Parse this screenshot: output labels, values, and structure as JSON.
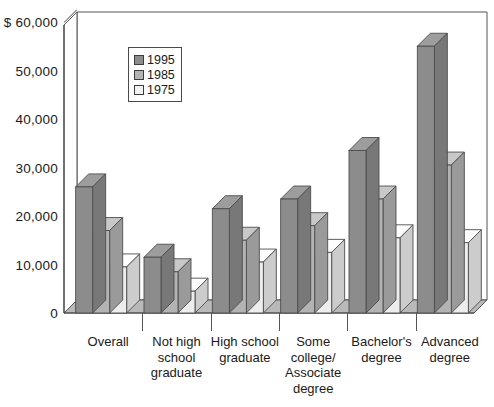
{
  "chart_data": {
    "type": "bar",
    "title": "",
    "subtitle": "",
    "xlabel": "",
    "ylabel": "",
    "y_axis_prefix": "$",
    "categories": [
      "Overall",
      "Not high\nschool\ngraduate",
      "High school\ngraduate",
      "Some\ncollege/\nAssociate\ndegree",
      "Bachelor's\ndegree",
      "Advanced\ndegree"
    ],
    "series": [
      {
        "name": "1995",
        "color": "#8c8c8c",
        "values": [
          26000,
          11500,
          21500,
          23500,
          33500,
          55000
        ]
      },
      {
        "name": "1985",
        "color": "#b3b3b3",
        "values": [
          17000,
          8500,
          15000,
          18000,
          23500,
          30500
        ]
      },
      {
        "name": "1975",
        "color": "#ededed",
        "values": [
          9500,
          4500,
          10500,
          12500,
          15500,
          14500
        ]
      }
    ],
    "ytick_values": [
      0,
      10000,
      20000,
      30000,
      40000,
      50000,
      60000
    ],
    "ytick_labels": [
      "0",
      "10,000",
      "20,000",
      "30,000",
      "40,000",
      "50,000",
      "$ 60,000"
    ],
    "ylim": [
      0,
      60000
    ],
    "grid": false,
    "legend_position": "top-left-inside",
    "three_d": true
  },
  "legend": {
    "items": [
      {
        "label": "1995"
      },
      {
        "label": "1985"
      },
      {
        "label": "1975"
      }
    ]
  }
}
